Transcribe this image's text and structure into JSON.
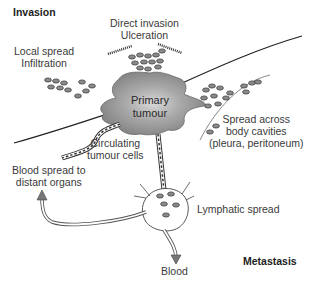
{
  "sections": {
    "invasion": "Invasion",
    "metastasis": "Metastasis"
  },
  "labels": {
    "direct_invasion": [
      "Direct invasion",
      "Ulceration"
    ],
    "local_spread": [
      "Local spread",
      "Infiltration"
    ],
    "primary_tumour": [
      "Primary",
      "tumour"
    ],
    "spread_cavities": [
      "Spread across",
      "body cavities",
      "(pleura, peritoneum)"
    ],
    "circulating": [
      "Circulating",
      "tumour cells"
    ],
    "blood_spread": [
      "Blood spread to",
      "distant organs"
    ],
    "lymphatic": "Lymphatic spread",
    "blood": "Blood"
  },
  "colors": {
    "tumour_fill": "#9a9a9a",
    "line": "#333333",
    "cell_fill": "#8a8a8a",
    "arrow_fill": "#777777"
  }
}
